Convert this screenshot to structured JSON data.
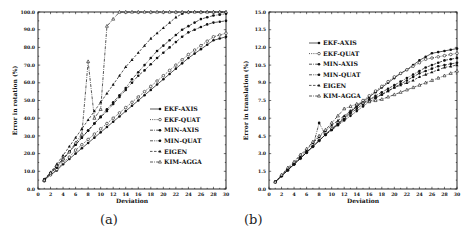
{
  "chart_data": [
    {
      "type": "line",
      "panel": "a",
      "caption": "(a)",
      "title": "",
      "xlabel": "Deviation",
      "ylabel": "Error in rotation (%)",
      "xlim": [
        0,
        30
      ],
      "ylim": [
        0,
        100
      ],
      "xticks": [
        0,
        2,
        4,
        6,
        8,
        10,
        12,
        14,
        16,
        18,
        20,
        22,
        24,
        26,
        28,
        30
      ],
      "yticks": [
        "0.0",
        "10.0",
        "20.0",
        "30.0",
        "40.0",
        "50.0",
        "60.0",
        "70.0",
        "80.0",
        "90.0",
        "100.0"
      ],
      "grid": false,
      "legend_position": "lower right inside",
      "x": [
        1,
        2,
        3,
        4,
        5,
        6,
        7,
        8,
        9,
        10,
        11,
        12,
        13,
        14,
        15,
        16,
        17,
        18,
        19,
        20,
        21,
        22,
        23,
        24,
        25,
        26,
        27,
        28,
        29,
        30
      ],
      "series": [
        {
          "name": "EKF-AXIS",
          "line": "solid",
          "marker": "filled-circle",
          "values": [
            5.5,
            8,
            10.5,
            14,
            17,
            20,
            23,
            26,
            29,
            32,
            35,
            38,
            41,
            44,
            47,
            50,
            53,
            56,
            59,
            62,
            65,
            68,
            71,
            74,
            76.5,
            79,
            81.5,
            84,
            85,
            86
          ]
        },
        {
          "name": "EKF-QUAT",
          "line": "dotted",
          "marker": "open-circle",
          "values": [
            4.5,
            8,
            11,
            15,
            18,
            22,
            25,
            28,
            31,
            34,
            37,
            40,
            43,
            46,
            49,
            52,
            55,
            58,
            61,
            64,
            67,
            70,
            73,
            76,
            78.5,
            81,
            83.5,
            86,
            87,
            88
          ]
        },
        {
          "name": "MIN-AXIS",
          "line": "dash-dot",
          "marker": "filled-circle",
          "values": [
            5,
            9,
            12,
            17,
            21,
            25,
            29,
            33,
            37,
            40.5,
            44,
            48,
            52,
            56,
            60,
            64,
            67,
            70.5,
            74,
            77,
            80,
            83,
            86,
            88.5,
            90,
            91.5,
            93,
            94,
            94.5,
            95
          ]
        },
        {
          "name": "MIN-QUAT",
          "line": "dash-dot-dot",
          "marker": "filled-circle",
          "values": [
            5,
            9,
            13,
            17,
            21,
            25,
            29,
            33,
            37,
            41,
            45,
            49,
            53,
            57,
            62,
            66,
            70,
            74,
            78,
            81,
            84,
            87,
            90,
            92,
            94,
            96,
            97,
            98,
            98.5,
            99
          ]
        },
        {
          "name": "EIGEN",
          "line": "dashed",
          "marker": "filled-triangle",
          "values": [
            5.5,
            9.5,
            14,
            19,
            24,
            29,
            34,
            39,
            44,
            49,
            54,
            59,
            64,
            69,
            73,
            77,
            81,
            85,
            88,
            91,
            94,
            97,
            99,
            100,
            100,
            100,
            100,
            100,
            100,
            100
          ]
        },
        {
          "name": "KIM-AGGA",
          "line": "dash-dot",
          "marker": "open-triangle",
          "values": [
            5,
            9,
            13,
            17,
            21,
            26,
            31,
            72,
            40,
            45,
            92,
            96,
            100,
            100,
            100,
            100,
            100,
            100,
            100,
            100,
            100,
            100,
            100,
            100,
            100,
            100,
            100,
            100,
            100,
            100
          ]
        }
      ]
    },
    {
      "type": "line",
      "panel": "b",
      "caption": "(b)",
      "title": "",
      "xlabel": "Deviation",
      "ylabel": "Error in translation (%)",
      "xlim": [
        0,
        30
      ],
      "ylim": [
        0,
        15
      ],
      "xticks": [
        0,
        2,
        4,
        6,
        8,
        10,
        12,
        14,
        16,
        18,
        20,
        22,
        24,
        26,
        28,
        30
      ],
      "yticks": [
        "0.0",
        "1.5",
        "3.0",
        "4.5",
        "6.0",
        "7.5",
        "9.0",
        "10.5",
        "12.0",
        "13.5",
        "15.0"
      ],
      "grid": false,
      "legend_position": "upper left inside",
      "x": [
        1,
        2,
        3,
        4,
        5,
        6,
        7,
        8,
        9,
        10,
        11,
        12,
        13,
        14,
        15,
        16,
        17,
        18,
        19,
        20,
        21,
        22,
        23,
        24,
        25,
        26,
        27,
        28,
        29,
        30
      ],
      "series": [
        {
          "name": "EKF-AXIS",
          "line": "solid",
          "marker": "filled-circle",
          "values": [
            0.6,
            1.1,
            1.6,
            2.1,
            2.6,
            3.1,
            3.6,
            4.1,
            4.6,
            5.1,
            5.5,
            6.0,
            6.5,
            7.0,
            7.4,
            7.8,
            8.2,
            8.6,
            9.0,
            9.4,
            9.8,
            10.1,
            10.5,
            10.9,
            11.2,
            11.5,
            11.6,
            11.7,
            11.8,
            11.9
          ]
        },
        {
          "name": "EKF-QUAT",
          "line": "dotted",
          "marker": "open-circle",
          "values": [
            0.6,
            1.1,
            1.6,
            2.1,
            2.6,
            3.1,
            3.6,
            4.1,
            4.6,
            5.1,
            5.6,
            6.1,
            6.6,
            7.1,
            7.5,
            7.9,
            8.3,
            8.7,
            9.1,
            9.5,
            9.8,
            10.1,
            10.4,
            10.7,
            11.0,
            11.1,
            11.2,
            11.3,
            11.4,
            11.5
          ]
        },
        {
          "name": "MIN-AXIS",
          "line": "dash-dot",
          "marker": "filled-circle",
          "values": [
            0.6,
            1.1,
            1.6,
            2.1,
            2.6,
            3.1,
            3.6,
            4.1,
            4.6,
            5.0,
            5.5,
            5.9,
            6.4,
            6.8,
            7.2,
            7.6,
            7.9,
            8.2,
            8.5,
            8.8,
            9.1,
            9.4,
            9.7,
            10.0,
            10.3,
            10.5,
            10.7,
            10.9,
            11.0,
            11.1
          ]
        },
        {
          "name": "MIN-QUAT",
          "line": "dash-dot-dot",
          "marker": "filled-circle",
          "values": [
            0.6,
            1.1,
            1.6,
            2.1,
            2.6,
            3.1,
            3.6,
            5.6,
            4.6,
            5.0,
            5.4,
            5.8,
            6.2,
            6.6,
            7.0,
            7.4,
            7.7,
            8.0,
            8.3,
            8.6,
            8.9,
            9.2,
            9.5,
            9.8,
            10.0,
            10.2,
            10.4,
            10.5,
            10.6,
            10.7
          ]
        },
        {
          "name": "EIGEN",
          "line": "dashed",
          "marker": "filled-triangle",
          "values": [
            0.6,
            1.1,
            1.7,
            2.2,
            2.8,
            3.3,
            3.9,
            4.4,
            4.9,
            5.4,
            5.8,
            6.2,
            6.6,
            7.0,
            7.3,
            7.6,
            7.8,
            8.0,
            8.3,
            8.6,
            8.8,
            9.0,
            9.2,
            9.5,
            9.7,
            9.9,
            10.1,
            10.3,
            10.4,
            10.5
          ]
        },
        {
          "name": "KIM-AGGA",
          "line": "dash-dot",
          "marker": "open-triangle",
          "values": [
            0.6,
            1.2,
            1.8,
            2.3,
            2.9,
            3.4,
            4.0,
            4.5,
            5.0,
            5.6,
            6.2,
            6.8,
            7.0,
            7.2,
            7.3,
            7.4,
            7.5,
            7.6,
            7.8,
            8.0,
            8.2,
            8.4,
            8.6,
            8.8,
            9.0,
            9.2,
            9.4,
            9.6,
            9.8,
            10.0
          ]
        }
      ]
    }
  ],
  "captions": {
    "a": "(a)",
    "b": "(b)"
  }
}
